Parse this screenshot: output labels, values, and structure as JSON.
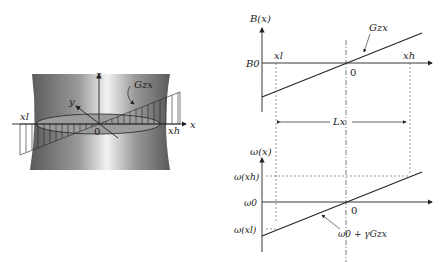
{
  "left_diagram": {
    "axes": {
      "x": "x",
      "y": "y",
      "z": "z",
      "origin": "0"
    },
    "labels": {
      "gradient": "Gzx",
      "x_low": "xl",
      "x_high": "xh"
    }
  },
  "top_graph": {
    "y_axis_label": "B(x)",
    "baseline_label": "B0",
    "line_label": "Gzx",
    "x_low": "xl",
    "x_high": "xh",
    "origin": "0",
    "span_label": "Lx"
  },
  "bottom_graph": {
    "y_axis_label": "ω(x)",
    "tick_high": "ω(xh)",
    "baseline_label": "ω0",
    "tick_low": "ω(xl)",
    "origin": "0",
    "line_label": "ω0 + γGzx"
  }
}
